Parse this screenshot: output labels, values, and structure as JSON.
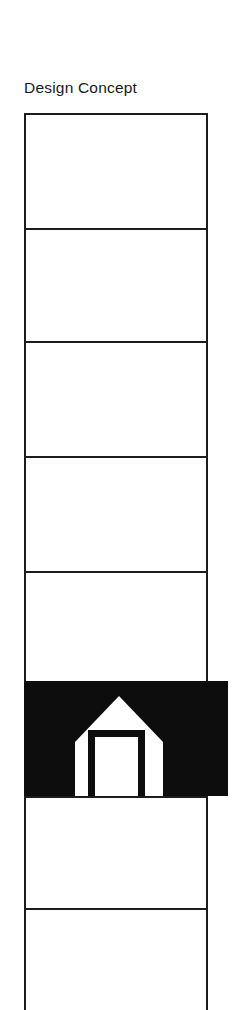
{
  "page": {
    "title": "Design Concept",
    "background_color": "#ffffff",
    "ink_color": "#1c1c1c"
  },
  "table": {
    "name": "design-concept-table",
    "column_count": 1,
    "border_color": "#1c1c1c",
    "border_width_px": 2,
    "rows": [
      {
        "label": "",
        "height_px": 115,
        "fill": "#ffffff"
      },
      {
        "label": "",
        "height_px": 113,
        "fill": "#ffffff"
      },
      {
        "label": "",
        "height_px": 115,
        "fill": "#ffffff"
      },
      {
        "label": "",
        "height_px": 115,
        "fill": "#ffffff"
      },
      {
        "label": "",
        "height_px": 110,
        "fill": "#ffffff"
      },
      {
        "label": "",
        "height_px": 115,
        "fill": "#0d0d0d"
      },
      {
        "label": "",
        "height_px": 112,
        "fill": "#ffffff"
      },
      {
        "label": "",
        "height_px": 102,
        "fill": "#ffffff"
      }
    ]
  },
  "highlight_band": {
    "name": "black-highlight-band",
    "fill_color": "#0d0d0d",
    "icon": "house-icon",
    "icon_color": "#ffffff",
    "icon_detail_color": "#0d0d0d"
  }
}
